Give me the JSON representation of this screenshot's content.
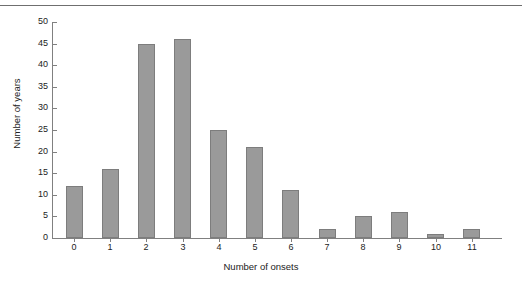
{
  "figure": {
    "top_rule": true,
    "background_color": "#ffffff"
  },
  "chart_data": {
    "type": "bar",
    "title": "",
    "subtitle": "",
    "xlabel": "Number of onsets",
    "ylabel": "Number of years",
    "categories": [
      "0",
      "1",
      "2",
      "3",
      "4",
      "5",
      "6",
      "7",
      "8",
      "9",
      "10",
      "11"
    ],
    "values": [
      12,
      16,
      45,
      46,
      25,
      21,
      11,
      2,
      5,
      6,
      1,
      2
    ],
    "series": [
      {
        "name": "Number of years",
        "values": [
          12,
          16,
          45,
          46,
          25,
          21,
          11,
          2,
          5,
          6,
          1,
          2
        ]
      }
    ],
    "ylim": [
      0,
      50
    ],
    "y_ticks": [
      0,
      5,
      10,
      15,
      20,
      25,
      30,
      35,
      40,
      45,
      50
    ],
    "y_tick_labels": [
      "0",
      "5",
      "10",
      "15",
      "20",
      "25",
      "30",
      "35",
      "40",
      "45",
      "50"
    ],
    "x_tick_labels": [
      "0",
      "1",
      "2",
      "3",
      "4",
      "5",
      "6",
      "7",
      "8",
      "9",
      "10",
      "11"
    ],
    "grid": false,
    "legend": null,
    "legend_position": "none",
    "bar_color": "#9a9a9a",
    "bar_edge_color": "#7d7d7d",
    "axis_color": "#808080",
    "text_color": "#222222",
    "annotations": []
  }
}
